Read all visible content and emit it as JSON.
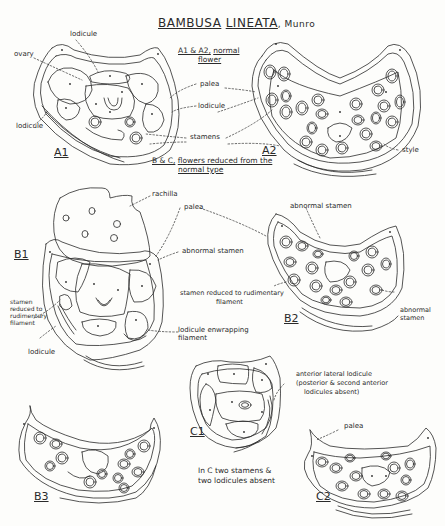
{
  "title": {
    "genus": "BAMBUSA",
    "species": "LINEATA",
    "author": ", Munro"
  },
  "section_headers": {
    "a": {
      "ids": "A1 & A2,",
      "text": "normal",
      "text2": "flower"
    },
    "bc": {
      "ids": "B & C,",
      "text": "flowers reduced from the",
      "text2": "normal type"
    }
  },
  "figures": {
    "A1": "A1",
    "A2": "A2",
    "B1": "B1",
    "B2": "B2",
    "B3": "B3",
    "C1": "C1",
    "C2": "C2"
  },
  "labels": {
    "lodicule_top": "lodicule",
    "ovary": "ovary",
    "lodicule_left_a1": "lodicule",
    "palea_a": "palea",
    "lodicule_a": "lodicule",
    "stamens": "stamens",
    "style": "style",
    "rachilla": "rachilla",
    "palea_b": "palea",
    "abnormal_stamen_b1": "abnormal stamen",
    "abnormal_stamen_b2_top": "abnormal stamen",
    "stamen_reduced_b2_1": "stamen reduced to rudimentary",
    "stamen_reduced_b2_2": "filament",
    "abnormal_stamen_b2_right_1": "abnormal",
    "abnormal_stamen_b2_right_2": "stamen",
    "stamen_reduced_b1_1": "stamen",
    "stamen_reduced_b1_2": "reduced to",
    "stamen_reduced_b1_3": "rudimentary",
    "stamen_reduced_b1_4": "filament",
    "lodicule_b1": "lodicule",
    "lodicule_enwrapping_1": "lodicule enwrapping",
    "lodicule_enwrapping_2": "filament",
    "anterior_lateral_1": "anterior lateral lodicule",
    "anterior_lateral_2": "(posterior & second anterior",
    "anterior_lateral_3": "lodicules absent)",
    "palea_c2": "palea",
    "note_c_1": "In C two stamens &",
    "note_c_2": "two lodicules absent"
  },
  "colors": {
    "ink": "#2a2a2a",
    "paper": "#fdfdfb"
  }
}
